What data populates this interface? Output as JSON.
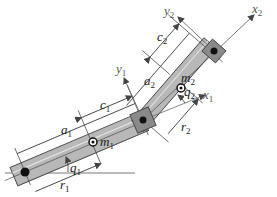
{
  "diagram": {
    "type": "two-link planar manipulator",
    "colors": {
      "link_fill": "#b4b4b4",
      "link_stroke": "#444444",
      "line": "#333333",
      "axis": "#666666",
      "joint": "#111111"
    },
    "labels": {
      "x2": {
        "base": "x",
        "sub": "2"
      },
      "y2": {
        "base": "y",
        "sub": "2"
      },
      "c2": {
        "base": "c",
        "sub": "2"
      },
      "y1": {
        "base": "y",
        "sub": "1"
      },
      "a2": {
        "base": "a",
        "sub": "2"
      },
      "m2": {
        "base": "m",
        "sub": "2"
      },
      "q2": {
        "base": "q",
        "sub": "2"
      },
      "x1": {
        "base": "x",
        "sub": "1"
      },
      "c1": {
        "base": "c",
        "sub": "1"
      },
      "r2": {
        "base": "r",
        "sub": "2"
      },
      "a1": {
        "base": "a",
        "sub": "1"
      },
      "m1": {
        "base": "m",
        "sub": "1"
      },
      "q1": {
        "base": "q",
        "sub": "1"
      },
      "r1": {
        "base": "r",
        "sub": "1"
      }
    }
  }
}
